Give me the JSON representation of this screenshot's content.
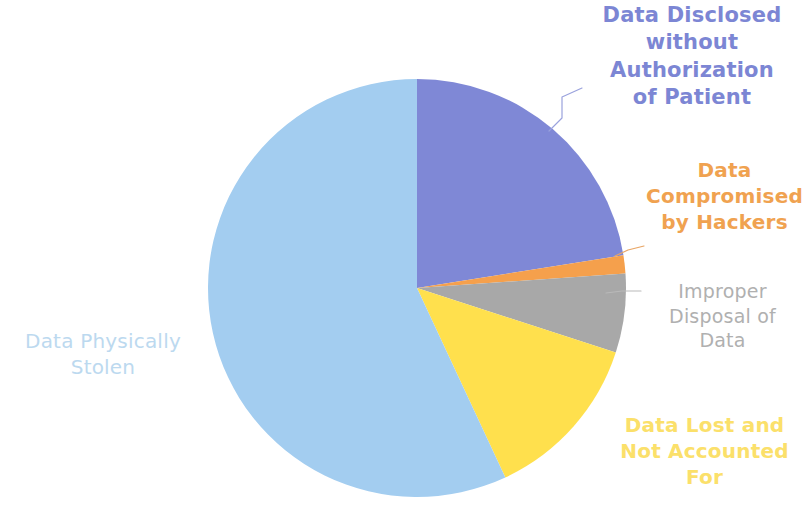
{
  "chart_data": {
    "type": "pie",
    "title": "",
    "subtitle": "",
    "xlabel": "",
    "ylabel": "",
    "legend_position": "none",
    "grid": false,
    "labels_position": "outside-callout",
    "start_angle_deg": 0,
    "direction": "clockwise",
    "categories": [
      "Data Disclosed without Authorization of Patient",
      "Data Compromised by Hackers",
      "Improper Disposal of Data",
      "Data Lost and Not Accounted For",
      "Data Physically Stolen"
    ],
    "values": [
      22.5,
      1.4,
      6.1,
      13.1,
      56.9
    ],
    "units": "percent",
    "angles_deg": [
      81,
      5,
      22,
      47,
      205
    ],
    "colors": [
      "#7f88d6",
      "#f5a04c",
      "#a8a8a8",
      "#ffe04d",
      "#a3cdf0"
    ],
    "slices": [
      {
        "label": "Data Disclosed without Authorization of Patient",
        "value": 22.5,
        "start_deg": 0,
        "end_deg": 81,
        "color": "#7f88d6",
        "label_color": "#7c86d4",
        "has_callout": true
      },
      {
        "label": "Data Compromised by Hackers",
        "value": 1.4,
        "start_deg": 81,
        "end_deg": 86,
        "color": "#f5a04c",
        "label_color": "#f0a250",
        "has_callout": true
      },
      {
        "label": "Improper Disposal of Data",
        "value": 6.1,
        "start_deg": 86,
        "end_deg": 108,
        "color": "#a8a8a8",
        "label_color": "#b0b0b0",
        "has_callout": true
      },
      {
        "label": "Data Lost and Not Accounted For",
        "value": 13.1,
        "start_deg": 108,
        "end_deg": 155,
        "color": "#ffe04d",
        "label_color": "#fbe06a",
        "has_callout": false
      },
      {
        "label": "Data Physically Stolen",
        "value": 56.9,
        "start_deg": 155,
        "end_deg": 360,
        "color": "#a3cdf0",
        "label_color": "#bcd9ef",
        "has_callout": false
      }
    ]
  },
  "labels": {
    "disclosed": {
      "line1": "Data Disclosed",
      "line2": "without",
      "line3": "Authorization",
      "line4": "of Patient",
      "color": "#7c86d4"
    },
    "hackers": {
      "line1": "Data",
      "line2": "Compromised",
      "line3": "by Hackers",
      "color": "#f0a250"
    },
    "improper": {
      "line1": "Improper",
      "line2": "Disposal of",
      "line3": "Data",
      "color": "#b0b0b0"
    },
    "lost": {
      "line1": "Data Lost and",
      "line2": "Not Accounted",
      "line3": "For",
      "color": "#fbe06a"
    },
    "stolen": {
      "line1": "Data Physically",
      "line2": "Stolen",
      "color": "#bcd9ef"
    }
  },
  "background": "#ffffff"
}
